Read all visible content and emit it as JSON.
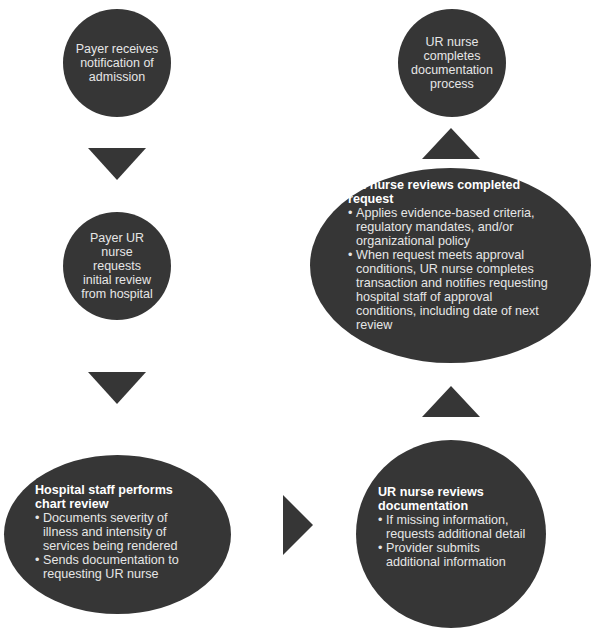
{
  "colors": {
    "shape_fill": "#363636",
    "text": "#e6e6e6",
    "background": "#ffffff"
  },
  "nodes": {
    "payer_receives": {
      "lines": [
        "Payer receives",
        "notification of",
        "admission"
      ]
    },
    "payer_ur_nurse": {
      "lines": [
        "Payer UR",
        "nurse",
        "requests",
        "initial review",
        "from hospital"
      ]
    },
    "hospital_chart_review": {
      "title": "Hospital staff performs chart review",
      "bullets": [
        "Documents severity of illness and intensity of services being rendered",
        "Sends documentation to requesting UR nurse"
      ]
    },
    "ur_reviews_documentation": {
      "title": "UR nurse reviews documentation",
      "bullets": [
        "If missing information, requests additional detail",
        "Provider submits additional information"
      ]
    },
    "ur_reviews_completed": {
      "title": "UR nurse reviews completed request",
      "bullets": [
        "Applies evidence-based criteria, regulatory mandates, and/or organizational policy",
        "When request meets approval conditions, UR nurse completes transaction and notifies requesting hospital staff of approval conditions, including date of next review"
      ]
    },
    "ur_completes": {
      "lines": [
        "UR nurse",
        "completes",
        "documentation",
        "process"
      ]
    }
  },
  "arrows": [
    {
      "from": "payer_receives",
      "to": "payer_ur_nurse",
      "direction": "down"
    },
    {
      "from": "payer_ur_nurse",
      "to": "hospital_chart_review",
      "direction": "down"
    },
    {
      "from": "hospital_chart_review",
      "to": "ur_reviews_documentation",
      "direction": "right"
    },
    {
      "from": "ur_reviews_documentation",
      "to": "ur_reviews_completed",
      "direction": "up"
    },
    {
      "from": "ur_reviews_completed",
      "to": "ur_completes",
      "direction": "up"
    }
  ]
}
